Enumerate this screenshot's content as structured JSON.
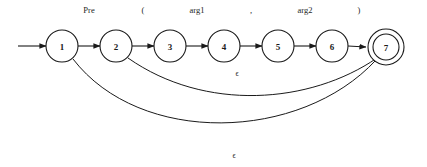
{
  "figure": {
    "background_color": "#ffffff",
    "stroke_color": "#1a1a1a"
  },
  "automaton": {
    "start_state": "1",
    "accept_states": [
      "7"
    ],
    "states": [
      {
        "id": "s1",
        "label": "1",
        "cx": 62,
        "cy": 46,
        "r": 16,
        "accepting": false
      },
      {
        "id": "s2",
        "label": "2",
        "cx": 116,
        "cy": 46,
        "r": 16,
        "accepting": false
      },
      {
        "id": "s3",
        "label": "3",
        "cx": 170,
        "cy": 46,
        "r": 16,
        "accepting": false
      },
      {
        "id": "s4",
        "label": "4",
        "cx": 224,
        "cy": 46,
        "r": 16,
        "accepting": false
      },
      {
        "id": "s5",
        "label": "5",
        "cx": 278,
        "cy": 46,
        "r": 16,
        "accepting": false
      },
      {
        "id": "s6",
        "label": "6",
        "cx": 332,
        "cy": 46,
        "r": 16,
        "accepting": false
      },
      {
        "id": "s7",
        "label": "7",
        "cx": 386,
        "cy": 47,
        "r": 13,
        "r_outer": 18,
        "accepting": true
      }
    ],
    "transitions": [
      {
        "id": "t1",
        "from": "1",
        "to": "2",
        "label": "Pre",
        "label_x": 89,
        "label_y": 13
      },
      {
        "id": "t2",
        "from": "2",
        "to": "3",
        "label": "(",
        "label_x": 143,
        "label_y": 13
      },
      {
        "id": "t3",
        "from": "3",
        "to": "4",
        "label": "arg1",
        "label_x": 197,
        "label_y": 13
      },
      {
        "id": "t4",
        "from": "4",
        "to": "5",
        "label": ",",
        "label_x": 251,
        "label_y": 13
      },
      {
        "id": "t5",
        "from": "5",
        "to": "6",
        "label": "arg2",
        "label_x": 305,
        "label_y": 13
      },
      {
        "id": "t6",
        "from": "6",
        "to": "7",
        "label": ")",
        "label_x": 359,
        "label_y": 13
      }
    ],
    "epsilon_transitions": [
      {
        "id": "e1",
        "from": "2",
        "to": "7",
        "label": "ϵ",
        "label_x": 237,
        "label_y": 76
      },
      {
        "id": "e2",
        "from": "1",
        "to": "7",
        "label": "ϵ",
        "label_x": 234,
        "label_y": 158
      }
    ],
    "start_arrow": {
      "x1": 18,
      "y1": 46,
      "x2": 46,
      "y2": 46
    }
  }
}
